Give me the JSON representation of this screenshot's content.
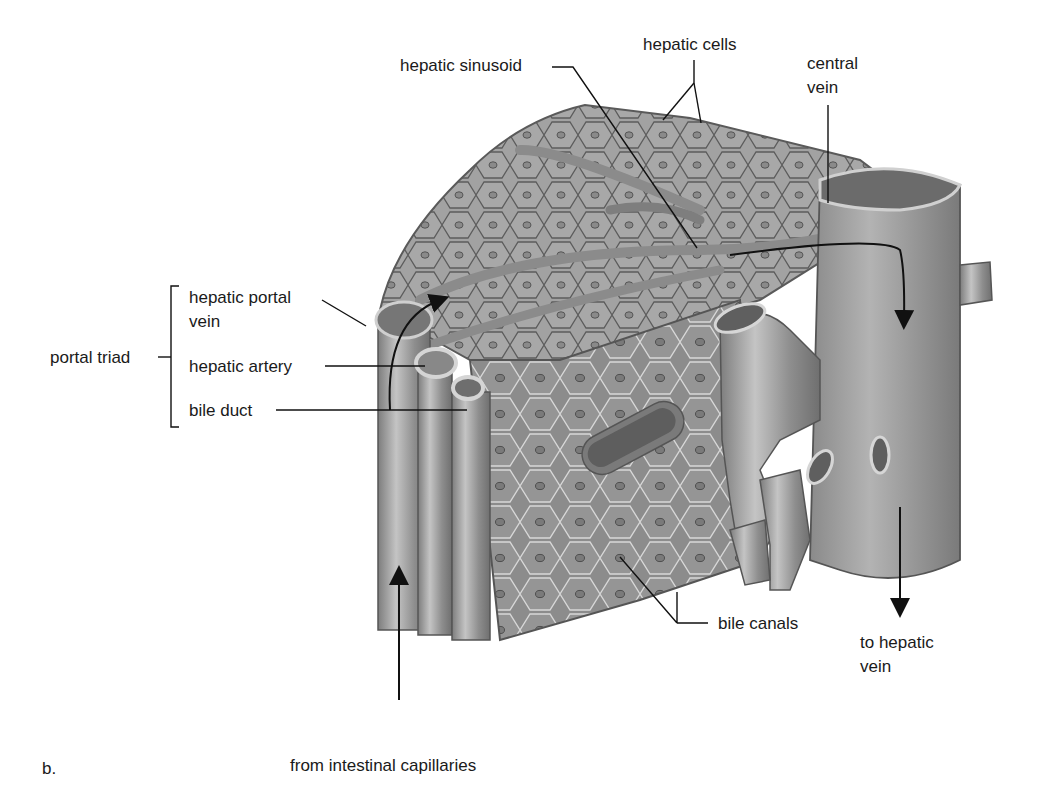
{
  "figure": {
    "panel_label": "b.",
    "colors": {
      "tissue": "#9a9a9a",
      "vessel": "#8c8c8c",
      "cell_outline": "#5a5a5a",
      "label_text": "#1a1a1a",
      "background": "#ffffff"
    }
  },
  "labels": {
    "hepatic_cells": "hepatic cells",
    "hepatic_sinusoid": "hepatic sinusoid",
    "central_vein_line1": "central",
    "central_vein_line2": "vein",
    "portal_triad": "portal triad",
    "hepatic_portal_vein_line1": "hepatic portal",
    "hepatic_portal_vein_line2": "vein",
    "hepatic_artery": "hepatic artery",
    "bile_duct": "bile duct",
    "bile_canals": "bile canals",
    "to_hepatic_vein_line1": "to hepatic",
    "to_hepatic_vein_line2": "vein",
    "from_intestinal_capillaries": "from intestinal capillaries"
  },
  "flow_arrows": [
    {
      "name": "portal-inflow",
      "description": "from intestinal capillaries up into hepatic portal vein"
    },
    {
      "name": "portal-to-sinusoid",
      "description": "curved arrow from portal vein into lobule"
    },
    {
      "name": "sinusoid-to-central-vein",
      "description": "curved arrow through sinusoid into central vein"
    },
    {
      "name": "central-vein-outflow",
      "description": "down to hepatic vein"
    }
  ]
}
